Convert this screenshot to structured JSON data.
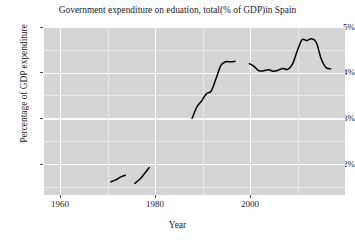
{
  "chart_data": {
    "type": "line",
    "title": "Government expenditure on eduation, total(% of GDP)in Spain",
    "xlabel": "Year",
    "ylabel": "Percentage of GDP expenditure",
    "xlim": [
      1956,
      2019
    ],
    "ylim": [
      1.55,
      5.12
    ],
    "grid": true,
    "legend": false,
    "x_ticks": [
      1960,
      1980,
      2000
    ],
    "x_tick_labels": [
      "1960",
      "1980",
      "2000"
    ],
    "y_ticks": [
      2,
      3,
      4,
      5
    ],
    "y_tick_labels": [
      "2%",
      "3%",
      "4%",
      "5%"
    ],
    "x_minor_ticks": [
      1970,
      1990,
      2010
    ],
    "y_minor_ticks": [
      1.5,
      2.5,
      3.5,
      4.5
    ],
    "line_color": "#000000",
    "panel_color": "#d5d5d5",
    "gridline_color": "#ffffff",
    "series": [
      {
        "name": "Government expenditure on education, total (% of GDP) - Spain",
        "segments": [
          {
            "name": "early-1970s-segment",
            "x": [
              1970,
              1971,
              1972,
              1973
            ],
            "y": [
              1.83,
              1.87,
              1.93,
              1.97
            ]
          },
          {
            "name": "late-1970s-segment",
            "x": [
              1975,
              1976,
              1977,
              1978
            ],
            "y": [
              1.8,
              1.88,
              2.0,
              2.13
            ]
          },
          {
            "name": "main-segment-1987-2000",
            "x": [
              1987,
              1988,
              1989,
              1990,
              1991,
              1992,
              1993,
              1994,
              1995,
              1996
            ],
            "y": [
              3.18,
              3.42,
              3.55,
              3.7,
              3.76,
              4.02,
              4.3,
              4.38,
              4.38,
              4.39
            ]
          },
          {
            "name": "main-segment-1999-2016",
            "x": [
              1999,
              2000,
              2001,
              2002,
              2003,
              2004,
              2005,
              2006,
              2007,
              2008,
              2009,
              2010,
              2011,
              2012,
              2013,
              2014,
              2015,
              2016
            ],
            "y": [
              4.34,
              4.28,
              4.19,
              4.19,
              4.21,
              4.18,
              4.2,
              4.24,
              4.22,
              4.33,
              4.61,
              4.85,
              4.83,
              4.87,
              4.79,
              4.45,
              4.26,
              4.23
            ]
          }
        ]
      }
    ]
  }
}
